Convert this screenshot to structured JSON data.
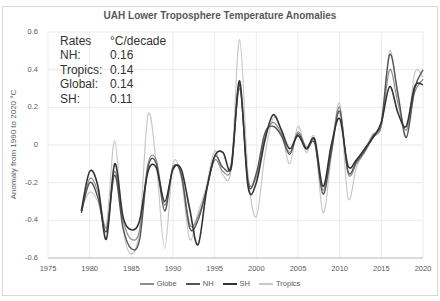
{
  "chart_data": {
    "type": "line",
    "title": "UAH Lower Troposphere Temperature Anomalies",
    "xlabel": "",
    "ylabel": "Anomaly from 1990 to 2020 °C",
    "xlim": [
      1975,
      2020
    ],
    "ylim": [
      -0.6,
      0.6
    ],
    "x_ticks": [
      "1975",
      "1980",
      "1985",
      "1990",
      "1995",
      "2000",
      "2005",
      "2010",
      "2015",
      "2020"
    ],
    "y_ticks": [
      "0.6",
      "0.4",
      "0.2",
      "0",
      "-0.2",
      "-0.4",
      "-0.6"
    ],
    "grid": true,
    "legend_position": "bottom",
    "x": [
      1979,
      1980,
      1981,
      1982,
      1983,
      1984,
      1985,
      1986,
      1987,
      1988,
      1989,
      1990,
      1991,
      1992,
      1993,
      1994,
      1995,
      1996,
      1997,
      1998,
      1999,
      2000,
      2001,
      2002,
      2003,
      2004,
      2005,
      2006,
      2007,
      2008,
      2009,
      2010,
      2011,
      2012,
      2013,
      2014,
      2015,
      2016,
      2017,
      2018,
      2019,
      2020
    ],
    "series": [
      {
        "name": "Globe",
        "color": "#8c8c8c",
        "width": 1.2,
        "values": [
          -0.36,
          -0.18,
          -0.25,
          -0.44,
          -0.14,
          -0.4,
          -0.5,
          -0.45,
          -0.1,
          -0.08,
          -0.32,
          -0.12,
          -0.15,
          -0.42,
          -0.38,
          -0.24,
          -0.08,
          -0.14,
          -0.12,
          0.3,
          -0.18,
          -0.17,
          0.04,
          0.12,
          0.06,
          -0.04,
          0.07,
          -0.01,
          0.02,
          -0.24,
          -0.02,
          0.2,
          -0.15,
          -0.1,
          -0.04,
          0.04,
          0.1,
          0.4,
          0.22,
          0.08,
          0.28,
          0.35
        ]
      },
      {
        "name": "NH",
        "color": "#555555",
        "width": 1.4,
        "values": [
          -0.36,
          -0.2,
          -0.28,
          -0.46,
          -0.16,
          -0.44,
          -0.55,
          -0.5,
          -0.12,
          -0.1,
          -0.35,
          -0.12,
          -0.16,
          -0.44,
          -0.4,
          -0.24,
          -0.06,
          -0.12,
          -0.1,
          0.32,
          -0.2,
          -0.15,
          0.06,
          0.1,
          0.05,
          -0.05,
          0.06,
          -0.02,
          0.01,
          -0.26,
          -0.04,
          0.18,
          -0.14,
          -0.09,
          -0.03,
          0.05,
          0.12,
          0.48,
          0.27,
          0.04,
          0.3,
          0.4
        ]
      },
      {
        "name": "SH",
        "color": "#333333",
        "width": 1.6,
        "values": [
          -0.35,
          -0.14,
          -0.22,
          -0.5,
          -0.1,
          -0.38,
          -0.45,
          -0.4,
          -0.14,
          -0.12,
          -0.3,
          -0.13,
          -0.13,
          -0.34,
          -0.53,
          -0.25,
          -0.06,
          -0.04,
          -0.12,
          0.34,
          -0.22,
          -0.2,
          0.02,
          0.16,
          0.08,
          -0.02,
          0.05,
          -0.02,
          0.03,
          -0.22,
          0.0,
          0.14,
          -0.11,
          -0.08,
          -0.02,
          0.04,
          0.12,
          0.31,
          0.17,
          0.1,
          0.31,
          0.32
        ]
      },
      {
        "name": "Tropics",
        "color": "#c8c8c8",
        "width": 1.2,
        "values": [
          -0.34,
          -0.25,
          -0.3,
          -0.42,
          0.02,
          -0.44,
          -0.58,
          -0.44,
          0.16,
          -0.1,
          -0.55,
          -0.1,
          -0.18,
          -0.5,
          -0.36,
          -0.22,
          -0.03,
          -0.16,
          -0.12,
          0.56,
          -0.15,
          -0.38,
          -0.06,
          0.14,
          0.08,
          -0.1,
          0.1,
          -0.04,
          0.04,
          -0.36,
          -0.06,
          0.22,
          -0.28,
          -0.12,
          -0.03,
          0.06,
          0.1,
          0.5,
          0.25,
          0.04,
          0.38,
          0.36
        ]
      }
    ],
    "annotation": {
      "header": [
        "Rates",
        "°C/decade"
      ],
      "rows": [
        [
          "NH:",
          "0.16"
        ],
        [
          "Tropics:",
          "0.14"
        ],
        [
          "Global:",
          "0.14"
        ],
        [
          "SH:",
          "0.11"
        ]
      ]
    }
  },
  "legend": [
    {
      "label": "Globe",
      "color": "#8c8c8c"
    },
    {
      "label": "NH",
      "color": "#555555"
    },
    {
      "label": "SH",
      "color": "#333333"
    },
    {
      "label": "Tropics",
      "color": "#c8c8c8"
    }
  ]
}
